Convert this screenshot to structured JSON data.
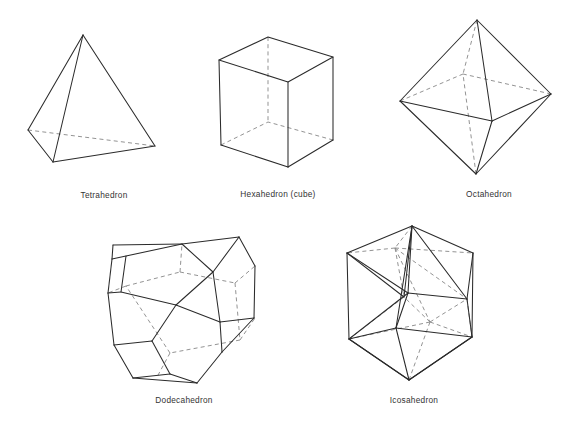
{
  "page": {
    "background_color": "#ffffff",
    "edge_color": "#2b2b2b",
    "hidden_edge_color": "#8d8d8d",
    "caption_color": "#333333",
    "width": 576,
    "height": 425
  },
  "figures": [
    {
      "id": "tetrahedron",
      "caption": "Tetrahedron",
      "faces": 4,
      "vertices": 4,
      "edges": 6,
      "face_shape": "triangle",
      "caption_x": 104,
      "caption_y": 198
    },
    {
      "id": "hexahedron",
      "caption": "Hexahedron (cube)",
      "faces": 6,
      "vertices": 8,
      "edges": 12,
      "face_shape": "square",
      "caption_x": 278,
      "caption_y": 197
    },
    {
      "id": "octahedron",
      "caption": "Octahedron",
      "faces": 8,
      "vertices": 6,
      "edges": 12,
      "face_shape": "triangle",
      "caption_x": 489,
      "caption_y": 197
    },
    {
      "id": "dodecahedron",
      "caption": "Dodecahedron",
      "faces": 12,
      "vertices": 20,
      "edges": 30,
      "face_shape": "pentagon",
      "caption_x": 184,
      "caption_y": 403
    },
    {
      "id": "icosahedron",
      "caption": "Icosahedron",
      "faces": 20,
      "vertices": 12,
      "edges": 30,
      "face_shape": "triangle",
      "caption_x": 414,
      "caption_y": 403
    }
  ]
}
